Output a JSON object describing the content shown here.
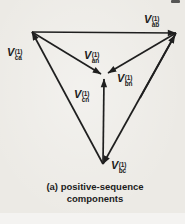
{
  "figure": {
    "caption_line1": "(a) positive-sequence",
    "caption_line2": "components",
    "labels": {
      "vab": {
        "base": "V",
        "sup": "(1)",
        "sub": "ab"
      },
      "vca": {
        "base": "V",
        "sup": "(1)",
        "sub": "ca"
      },
      "van": {
        "base": "V",
        "sup": "(1)",
        "sub": "an"
      },
      "vbn": {
        "base": "V",
        "sup": "(1)",
        "sub": "bn"
      },
      "vcn": {
        "base": "V",
        "sup": "(1)",
        "sub": "cn"
      },
      "vbc": {
        "base": "V",
        "sup": "(1)",
        "sub": "bc"
      }
    },
    "arrows": [
      {
        "name": "V_ab(1)",
        "from": "vertex-a-top-left",
        "to": "vertex-b-top-right"
      },
      {
        "name": "V_bc(1)",
        "from": "vertex-b-top-right",
        "to": "vertex-c-bottom"
      },
      {
        "name": "V_ca(1)",
        "from": "vertex-c-bottom",
        "to": "vertex-a-top-left"
      },
      {
        "name": "V_an(1)",
        "from": "vertex-a-top-left",
        "to": "center-n"
      },
      {
        "name": "V_bn(1)",
        "from": "vertex-b-top-right",
        "to": "center-n"
      },
      {
        "name": "V_cn(1)",
        "from": "vertex-c-bottom",
        "to": "center-n"
      }
    ],
    "colors": {
      "ink": "#1f1f1f",
      "paper": "#eceae5"
    }
  }
}
